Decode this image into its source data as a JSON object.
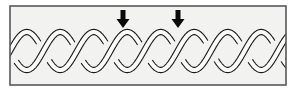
{
  "figure": {
    "canvas": {
      "width": 296,
      "height": 91
    },
    "background_color": "#ffffff",
    "panel": {
      "name": "diagram-frame",
      "x": 10,
      "y": 6,
      "width": 276,
      "height": 79,
      "fill_color": "#f2f2f0",
      "border_color": "#58585a",
      "border_width": 1.6
    },
    "braid": {
      "type": "two-strand-sinusoidal-braid",
      "strand_count": 2,
      "ribbon_outline_color": "#1a1a1a",
      "ribbon_fill_color": "#fbfbfa",
      "ribbon_width": 5.2,
      "outline_width": 1.1,
      "center_y": 51,
      "amplitude": 19,
      "period": 67,
      "phase_offset_degrees": 180,
      "x_start": 10,
      "x_end": 286,
      "crossing_count": 9,
      "lobe_peaks_x": [
        28,
        61,
        95,
        128,
        161,
        195,
        228,
        261
      ],
      "crossings_x": [
        11,
        44,
        78,
        111,
        145,
        178,
        211,
        245,
        278
      ]
    },
    "arrows": [
      {
        "name": "pointer-arrow-left",
        "label": "",
        "tip_x": 123,
        "tip_y": 28,
        "tail_y": 10,
        "color": "#0a0a0a",
        "direction": "down",
        "shaft_width": 5,
        "head_width": 13,
        "head_height": 9
      },
      {
        "name": "pointer-arrow-right",
        "label": "",
        "tip_x": 178,
        "tip_y": 28,
        "tail_y": 10,
        "color": "#0a0a0a",
        "direction": "down",
        "shaft_width": 5,
        "head_width": 13,
        "head_height": 9
      }
    ]
  }
}
